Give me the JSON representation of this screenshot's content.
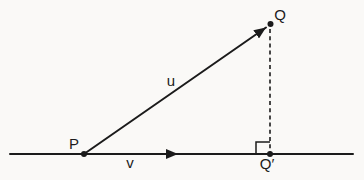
{
  "diagram": {
    "labels": {
      "point_p": "P",
      "point_q": "Q",
      "point_q_prime": "Q′",
      "vector_u": "u",
      "vector_v": "v"
    },
    "colors": {
      "background": "#faf9f7",
      "line": "#1b1b1b"
    }
  }
}
